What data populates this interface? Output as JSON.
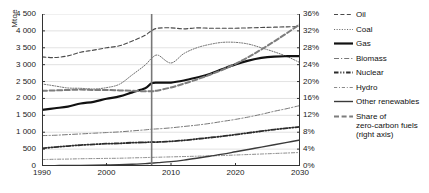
{
  "axes": {
    "y_left_title": "Mtoe",
    "y_left_ticks": [
      "4 500",
      "4 000",
      "3 500",
      "3 000",
      "2 500",
      "2 000",
      "1 500",
      "1 000",
      "500",
      "0"
    ],
    "y_right_ticks": [
      "36%",
      "32%",
      "28%",
      "24%",
      "20%",
      "16%",
      "12%",
      "8%",
      "4%",
      "0%"
    ],
    "x_ticks": [
      "1990",
      "2000",
      "2010",
      "2020",
      "2030"
    ]
  },
  "legend": {
    "items": [
      {
        "label": "Oil",
        "style": "dashed",
        "width": 1.1,
        "color": "#4a4a4a"
      },
      {
        "label": "Coal",
        "style": "dotted",
        "width": 1.0,
        "color": "#6b6b6b"
      },
      {
        "label": "Gas",
        "style": "solid",
        "width": 2.2,
        "color": "#111111"
      },
      {
        "label": "Biomass",
        "style": "dash-dot-long",
        "width": 1.0,
        "color": "#777777"
      },
      {
        "label": "Nuclear",
        "style": "dash-dot-dot",
        "width": 1.8,
        "color": "#2b2b2b"
      },
      {
        "label": "Hydro",
        "style": "dash-dot-fine",
        "width": 1.0,
        "color": "#8a8a8a"
      },
      {
        "label": "Other renewables",
        "style": "solid",
        "width": 1.4,
        "color": "#3a3a3a"
      },
      {
        "label": "Share of",
        "sub1": "zero-carbon fuels",
        "sub2": "(right axis)",
        "style": "dashed-thick",
        "width": 2.0,
        "color": "#7d7d7d"
      }
    ]
  },
  "chart_data": {
    "type": "line",
    "title": "",
    "xlabel": "",
    "ylabel": "Mtoe",
    "ylabel_right": "Share of zero-carbon fuels",
    "xlim": [
      1990,
      2030
    ],
    "ylim": [
      0,
      4500
    ],
    "ylim_right": [
      0,
      36
    ],
    "grid": true,
    "legend_position": "right",
    "annotations": [
      {
        "type": "vertical-line",
        "x": 2007,
        "label": "historical / projection divide"
      }
    ],
    "x": [
      1990,
      1992,
      1994,
      1996,
      1998,
      2000,
      2002,
      2004,
      2006,
      2007,
      2008,
      2010,
      2012,
      2014,
      2016,
      2018,
      2020,
      2022,
      2024,
      2026,
      2028,
      2030
    ],
    "series": [
      {
        "name": "Oil",
        "axis": "left",
        "unit": "Mtoe",
        "values": [
          3230,
          3210,
          3260,
          3370,
          3430,
          3500,
          3560,
          3700,
          3870,
          4010,
          4080,
          4090,
          4060,
          4090,
          4080,
          4080,
          4080,
          4090,
          4100,
          4110,
          4120,
          4130
        ]
      },
      {
        "name": "Coal",
        "axis": "left",
        "unit": "Mtoe",
        "values": [
          2430,
          2370,
          2310,
          2300,
          2280,
          2320,
          2420,
          2700,
          2990,
          3190,
          3280,
          3050,
          3330,
          3500,
          3600,
          3660,
          3660,
          3610,
          3500,
          3380,
          3240,
          3060
        ]
      },
      {
        "name": "Gas",
        "axis": "left",
        "unit": "Mtoe",
        "values": [
          1660,
          1710,
          1760,
          1850,
          1900,
          1990,
          2060,
          2180,
          2300,
          2450,
          2470,
          2470,
          2530,
          2620,
          2720,
          2870,
          3010,
          3120,
          3200,
          3240,
          3250,
          3250
        ]
      },
      {
        "name": "Biomass",
        "axis": "left",
        "unit": "Mtoe",
        "values": [
          900,
          910,
          930,
          950,
          970,
          990,
          1010,
          1040,
          1070,
          1090,
          1100,
          1130,
          1170,
          1210,
          1260,
          1320,
          1380,
          1450,
          1530,
          1620,
          1700,
          1790
        ]
      },
      {
        "name": "Nuclear",
        "axis": "left",
        "unit": "Mtoe",
        "values": [
          520,
          560,
          590,
          620,
          640,
          660,
          670,
          690,
          700,
          710,
          710,
          730,
          760,
          800,
          840,
          880,
          930,
          980,
          1030,
          1080,
          1120,
          1160
        ]
      },
      {
        "name": "Hydro",
        "axis": "left",
        "unit": "Mtoe",
        "values": [
          190,
          200,
          205,
          215,
          220,
          225,
          230,
          240,
          250,
          255,
          260,
          270,
          280,
          290,
          300,
          310,
          325,
          340,
          355,
          370,
          385,
          400
        ]
      },
      {
        "name": "Other renewables",
        "axis": "left",
        "unit": "Mtoe",
        "values": [
          10,
          12,
          14,
          18,
          22,
          28,
          35,
          50,
          70,
          85,
          100,
          130,
          175,
          230,
          290,
          350,
          420,
          490,
          560,
          630,
          700,
          770
        ]
      },
      {
        "name": "Share of zero-carbon fuels",
        "axis": "right",
        "unit": "%",
        "values": [
          17.8,
          17.9,
          18.0,
          18.1,
          18.0,
          18.0,
          17.9,
          17.8,
          17.7,
          17.7,
          17.9,
          18.6,
          19.5,
          20.5,
          21.6,
          22.8,
          24.2,
          25.8,
          27.6,
          29.5,
          31.5,
          33.6
        ]
      }
    ]
  }
}
